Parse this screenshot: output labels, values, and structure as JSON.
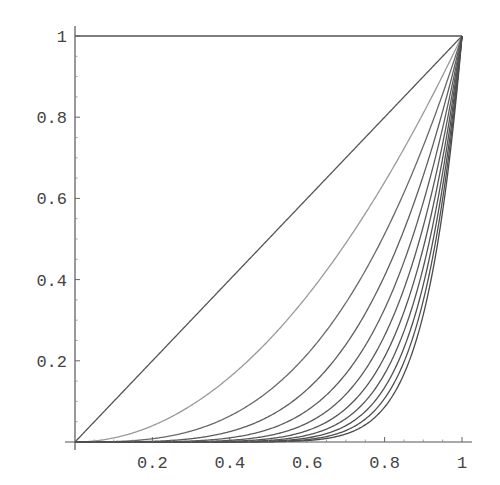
{
  "chart_data": {
    "type": "line",
    "title": "",
    "xlabel": "",
    "ylabel": "",
    "xlim": [
      0,
      1
    ],
    "ylim": [
      0,
      1
    ],
    "grid": false,
    "legend": null,
    "x_ticks": [
      0.2,
      0.4,
      0.6,
      0.8,
      1
    ],
    "x_tick_labels": [
      "0.2",
      "0.4",
      "0.6",
      "0.8",
      "1"
    ],
    "y_ticks": [
      0.2,
      0.4,
      0.6,
      0.8,
      1
    ],
    "y_tick_labels": [
      "0.2",
      "0.4",
      "0.6",
      "0.8",
      "1"
    ],
    "series": [
      {
        "name": "x^0",
        "exponent": 0,
        "color": "#555555",
        "x": [
          0,
          0.5,
          1
        ],
        "values": [
          1,
          1,
          1
        ]
      },
      {
        "name": "x^1",
        "exponent": 1,
        "color": "#555555",
        "x": [
          0,
          0.5,
          1
        ],
        "values": [
          0,
          0.5,
          1
        ]
      },
      {
        "name": "x^2",
        "exponent": 2,
        "color": "#9a9a9a",
        "x": [
          0,
          0.5,
          1
        ],
        "values": [
          0,
          0.25,
          1
        ]
      },
      {
        "name": "x^3",
        "exponent": 3,
        "color": "#6a6a6a",
        "x": [
          0,
          0.5,
          1
        ],
        "values": [
          0,
          0.125,
          1
        ]
      },
      {
        "name": "x^4",
        "exponent": 4,
        "color": "#5e5e5e",
        "x": [
          0,
          0.5,
          1
        ],
        "values": [
          0,
          0.0625,
          1
        ]
      },
      {
        "name": "x^5",
        "exponent": 5,
        "color": "#5e5e5e",
        "x": [
          0,
          0.5,
          1
        ],
        "values": [
          0,
          0.031,
          1
        ]
      },
      {
        "name": "x^6",
        "exponent": 6,
        "color": "#5a5a5a",
        "x": [
          0,
          0.5,
          1
        ],
        "values": [
          0,
          0.016,
          1
        ]
      },
      {
        "name": "x^7",
        "exponent": 7,
        "color": "#555555",
        "x": [
          0,
          0.5,
          1
        ],
        "values": [
          0,
          0.008,
          1
        ]
      },
      {
        "name": "x^8",
        "exponent": 8,
        "color": "#555555",
        "x": [
          0,
          0.5,
          1
        ],
        "values": [
          0,
          0.004,
          1
        ]
      },
      {
        "name": "x^9",
        "exponent": 9,
        "color": "#505050",
        "x": [
          0,
          0.5,
          1
        ],
        "values": [
          0,
          0.002,
          1
        ]
      },
      {
        "name": "x^10",
        "exponent": 10,
        "color": "#505050",
        "x": [
          0,
          0.5,
          1
        ],
        "values": [
          0,
          0.001,
          1
        ]
      },
      {
        "name": "x^11",
        "exponent": 11,
        "color": "#4a4a4a",
        "x": [
          0,
          0.5,
          1
        ],
        "values": [
          0,
          0.0005,
          1
        ]
      }
    ]
  },
  "plot_area": {
    "origin_px": [
      75,
      442
    ],
    "unit_px": [
      387,
      406
    ]
  }
}
